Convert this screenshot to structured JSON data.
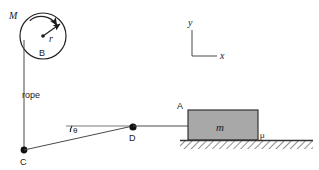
{
  "diagram": {
    "labels": {
      "pulley_mass": "M",
      "pulley_radius": "r",
      "pulley_name": "B",
      "rope": "rope",
      "point_c": "C",
      "point_d": "D",
      "point_a": "A",
      "angle": "θ",
      "block_mass": "m",
      "friction": "μ",
      "axis_x": "x",
      "axis_y": "y"
    },
    "colors": {
      "block_fill": "#a8a8a8",
      "block_stroke": "#333333",
      "line": "#4a4a4a",
      "ground_hatch": "#333333",
      "text": "#1a1a1a",
      "background": "#ffffff"
    },
    "geometry": {
      "pulley_center_x": 43,
      "pulley_center_y": 36,
      "pulley_radius_px": 23,
      "point_c_x": 24,
      "point_c_y": 150,
      "point_d_x": 133,
      "point_d_y": 126,
      "block_left": 188,
      "block_right": 258,
      "block_top": 110,
      "block_bottom": 140,
      "ground_left": 180,
      "ground_right": 313,
      "ground_top": 140,
      "axes_origin_x": 192,
      "axes_origin_y": 56
    }
  }
}
